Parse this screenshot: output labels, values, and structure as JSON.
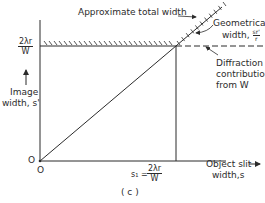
{
  "figure": {
    "caption": "( c )",
    "y_axis": {
      "label_line1": "Image",
      "label_line2": "width, s'",
      "tick_label_num": "2λr",
      "tick_label_den": "W",
      "origin_label": "O"
    },
    "x_axis": {
      "label_line1": "Object slit",
      "label_line2": "width,s",
      "origin_label": "O",
      "tick_label_prefix": "s₁ =",
      "tick_label_num": "2λr",
      "tick_label_den": "W"
    },
    "annotations": {
      "total_width": "Approximate total width",
      "geometrical_line1": "Geometrical",
      "geometrical_line2": "width,",
      "geometrical_frac_num": "sr'",
      "geometrical_frac_den": "r",
      "diffraction_line1": "Diffraction",
      "diffraction_line2": "contribution",
      "diffraction_line3": "from W"
    },
    "colors": {
      "ink": "#2b2b2b",
      "background": "#ffffff"
    }
  }
}
